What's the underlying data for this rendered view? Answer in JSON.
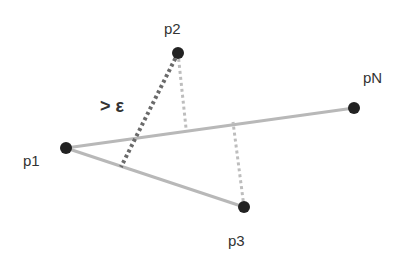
{
  "diagram": {
    "title": "",
    "points": [
      {
        "id": "p1",
        "label": "p1",
        "x": 66,
        "y": 148
      },
      {
        "id": "p2",
        "label": "p2",
        "x": 178,
        "y": 53
      },
      {
        "id": "p3",
        "label": "p3",
        "x": 244,
        "y": 207
      },
      {
        "id": "pN",
        "label": "pN",
        "x": 354,
        "y": 108
      }
    ],
    "edges": [
      {
        "from": "p1",
        "to": "pN",
        "style": "solid-light"
      },
      {
        "from": "p1",
        "to": "p3",
        "style": "solid-light"
      }
    ],
    "distances": [
      {
        "from": "p2",
        "to_line": "p1-p3",
        "style": "dotted-dark"
      },
      {
        "from": "p2",
        "to_line": "p1-pN",
        "style": "dotted-light"
      },
      {
        "from": "p3",
        "to_line": "p1-pN",
        "style": "dotted-light"
      }
    ],
    "annotation": "> ε",
    "colors": {
      "point": "#222222",
      "line": "#b5b5b5",
      "dark_dotted": "#666666",
      "light_dotted": "#b5b5b5"
    }
  }
}
